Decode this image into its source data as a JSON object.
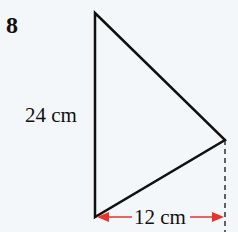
{
  "question_number": "8",
  "labels": {
    "height": "24 cm",
    "base": "12 cm"
  },
  "colors": {
    "line": "#111111",
    "arrow": "#e8332a",
    "background": "#f4f7fa"
  },
  "shape": {
    "type": "triangle",
    "vertices": [
      [
        95,
        13
      ],
      [
        225,
        140
      ],
      [
        95,
        217
      ]
    ],
    "height_cm": 24,
    "base_cm": 12
  }
}
